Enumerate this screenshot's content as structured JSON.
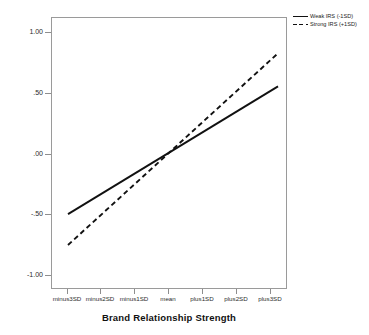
{
  "chart_data": {
    "type": "line",
    "title": "",
    "xlabel": "Brand Relationship Strength",
    "ylabel": "Ad Referral Acceptance",
    "categories": [
      "minus3SD",
      "minus2SD",
      "minus1SD",
      "mean",
      "plus1SD",
      "plus2SD",
      "plus3SD"
    ],
    "ylim": [
      -1.25,
      1.2
    ],
    "yticks": [
      "1.00",
      ".50",
      ".00",
      "-.50",
      "-1.00"
    ],
    "ytick_values": [
      1.0,
      0.5,
      0.0,
      -0.5,
      -1.0
    ],
    "grid": false,
    "legend_position": "top-right-outside",
    "series": [
      {
        "name": "Weak IRS (-1SD)",
        "style": "solid",
        "color": "#111111",
        "values": [
          -0.58,
          -0.39,
          -0.19,
          0.0,
          0.19,
          0.39,
          0.58
        ]
      },
      {
        "name": "Strong IRS (+1SD)",
        "style": "dashed",
        "color": "#111111",
        "values": [
          -0.86,
          -0.57,
          -0.29,
          0.01,
          0.3,
          0.59,
          0.88
        ]
      }
    ]
  },
  "axes": {
    "y_title": "Ad Referral Acceptance",
    "x_title": "Brand Relationship Strength",
    "y_tick_labels": [
      "1.00",
      ".50",
      ".00",
      "-.50",
      "-1.00"
    ],
    "x_tick_labels": [
      "minus3SD",
      "minus2SD",
      "minus1SD",
      "mean",
      "plus1SD",
      "plus2SD",
      "plus3SD"
    ]
  },
  "legend": {
    "items": [
      {
        "label": "Weak IRS (-1SD)",
        "style": "solid"
      },
      {
        "label": "Strong IRS (+1SD)",
        "style": "dashed"
      }
    ]
  }
}
